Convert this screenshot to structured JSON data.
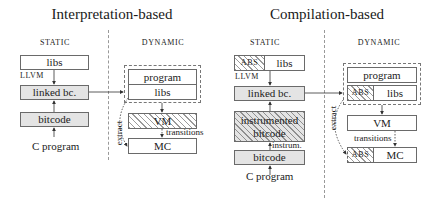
{
  "panels": [
    {
      "title": "Interpretation-based",
      "static_label": "STATIC",
      "dynamic_label": "DYNAMIC",
      "static": {
        "libs": "libs",
        "llvm_label": "LLVM",
        "linked": "linked bc.",
        "bitcode": "bitcode",
        "source": "C program"
      },
      "dynamic": {
        "program": "program",
        "libs": "libs",
        "vm": "VM",
        "mc": "MC",
        "transitions_label": "transitions",
        "extract_label": "extract"
      }
    },
    {
      "title": "Compilation-based",
      "static_label": "STATIC",
      "dynamic_label": "DYNAMIC",
      "static": {
        "abs": "ABS",
        "libs": "libs",
        "llvm_label": "LLVM",
        "linked": "linked bc.",
        "instrumented": "instrumented bitcode",
        "instrum_label": "instrum.",
        "bitcode": "bitcode",
        "source": "C program"
      },
      "dynamic": {
        "program": "program",
        "abs": "ABS",
        "libs": "libs",
        "vm": "VM",
        "mc": "MC",
        "mc_abs": "ABS",
        "transitions_label": "transitions",
        "extract_label": "extract"
      }
    }
  ],
  "legend": {
    "hatched": "hatched fill",
    "gray": "gray fill"
  }
}
